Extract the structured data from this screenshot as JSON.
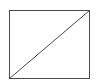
{
  "diagram": {
    "shape": "rectangle-with-diagonal",
    "rect": {
      "x": 9.5,
      "y": 10.5,
      "width": 80,
      "height": 68
    },
    "diagonal": {
      "x1": 9.5,
      "y1": 78.5,
      "x2": 89.5,
      "y2": 10.5
    },
    "stroke_color": "#4a4a4a"
  }
}
